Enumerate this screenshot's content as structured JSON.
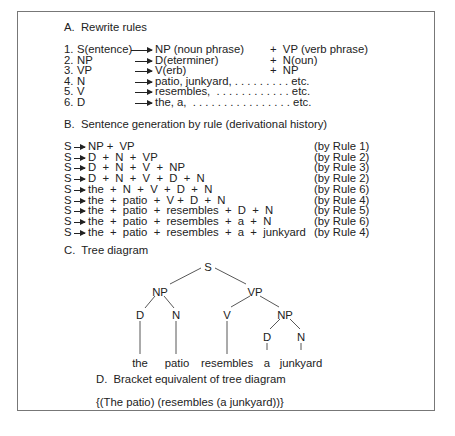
{
  "sectionA": {
    "title": "A.  Rewrite rules",
    "rules": [
      {
        "num": "1.",
        "lhs": "S(entence)",
        "rhs1": "NP (noun phrase)",
        "rhs2": "+  VP (verb phrase)"
      },
      {
        "num": "2.",
        "lhs": "NP",
        "rhs1": "D(eterminer)",
        "rhs2": "+  N(oun)"
      },
      {
        "num": "3.",
        "lhs": "VP",
        "rhs1": "V(erb)",
        "rhs2": "+  NP"
      },
      {
        "num": "4.",
        "lhs": "N",
        "rhs1": "patio, junkyard, . . . . . . . . . etc.",
        "rhs2": ""
      },
      {
        "num": "5.",
        "lhs": "V",
        "rhs1": "resembles,  . . . . . . . . . . . . etc.",
        "rhs2": ""
      },
      {
        "num": "6.",
        "lhs": "D",
        "rhs1": "the, a,  . . . . . . . . . . . . . . . . etc.",
        "rhs2": ""
      }
    ]
  },
  "sectionB": {
    "title": "B.  Sentence generation by rule (derivational history)",
    "steps": [
      {
        "lhs": "S",
        "rhs": "NP +  VP",
        "rule": "(by Rule 1)"
      },
      {
        "lhs": "S",
        "rhs": "D  +  N  +  VP",
        "rule": "(by Rule 2)"
      },
      {
        "lhs": "S",
        "rhs": "D  +  N  +  V  +  NP",
        "rule": "(by Rule 3)"
      },
      {
        "lhs": "S",
        "rhs": "D  +  N  +  V  +  D  +  N",
        "rule": "(by Rule 2)"
      },
      {
        "lhs": "S",
        "rhs": "the  +  N  +  V  +  D  +  N",
        "rule": "(by Rule 6)"
      },
      {
        "lhs": "S",
        "rhs": "the  +  patio  +  V +  D  +  N",
        "rule": "(by Rule 4)"
      },
      {
        "lhs": "S",
        "rhs": "the  +  patio  +  resembles  +  D  +  N",
        "rule": "(by Rule 5)"
      },
      {
        "lhs": "S",
        "rhs": "the  +  patio  +  resembles  +  a  +  N",
        "rule": "(by Rule 6)"
      },
      {
        "lhs": "S",
        "rhs": "the  +  patio  +  resembles  +  a  +  junkyard",
        "rule": "(by Rule 4)"
      }
    ]
  },
  "sectionC": {
    "title": "C.  Tree diagram",
    "nodes": {
      "root": "S",
      "np1": "NP",
      "vp": "VP",
      "d1": "D",
      "n1": "N",
      "v": "V",
      "np2": "NP",
      "d2": "D",
      "n2": "N",
      "w1": "the",
      "w2": "patio",
      "w3": "resembles",
      "w4": "a",
      "w5": "junkyard"
    }
  },
  "sectionD": {
    "title": "D.  Bracket equivalent of tree diagram",
    "bracket": "{(The patio) (resembles (a junkyard))}"
  }
}
